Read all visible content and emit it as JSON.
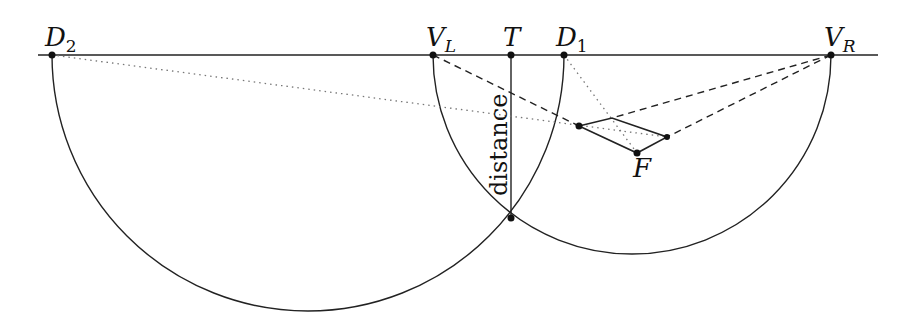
{
  "diagram": {
    "title": "",
    "horizon": {
      "y": 55,
      "x1": 38,
      "x2": 878
    },
    "points": [
      {
        "id": "D2",
        "label": "D",
        "sub": "2",
        "sub_italic": false,
        "x": 52,
        "y": 55
      },
      {
        "id": "VL",
        "label": "V",
        "sub": "L",
        "sub_italic": true,
        "x": 433,
        "y": 55
      },
      {
        "id": "T",
        "label": "T",
        "sub": "",
        "sub_italic": false,
        "x": 511,
        "y": 55
      },
      {
        "id": "D1",
        "label": "D",
        "sub": "1",
        "sub_italic": false,
        "x": 564,
        "y": 55
      },
      {
        "id": "VR",
        "label": "V",
        "sub": "R",
        "sub_italic": true,
        "x": 831,
        "y": 55
      }
    ],
    "distance_label": "distance",
    "F_label": "F",
    "arcs": [
      {
        "name": "left-semicircle",
        "cx": 308,
        "cy": 55,
        "r": 256
      },
      {
        "name": "right-semicircle",
        "cx": 632,
        "cy": 55,
        "r": 199
      }
    ],
    "intersection": {
      "x": 511,
      "y": 218
    },
    "rhombus": [
      {
        "x": 579,
        "y": 126
      },
      {
        "x": 612,
        "y": 118
      },
      {
        "x": 667,
        "y": 137
      },
      {
        "x": 637,
        "y": 153
      }
    ],
    "colors": {
      "stroke": "#222222",
      "dotted": "#777777",
      "background": "#ffffff"
    }
  }
}
